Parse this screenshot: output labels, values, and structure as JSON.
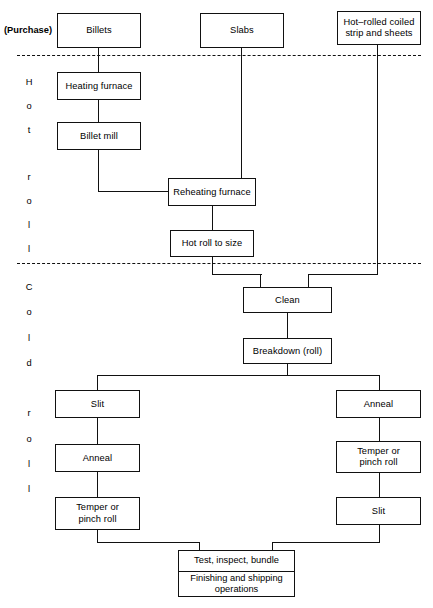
{
  "diagram": {
    "purchase_label": "(Purchase)",
    "stage_labels": {
      "hot": [
        "H",
        "o",
        "t",
        "",
        "r",
        "o",
        "l",
        "l"
      ],
      "cold": [
        "C",
        "o",
        "l",
        "d",
        "",
        "r",
        "o",
        "l",
        "l"
      ]
    },
    "nodes": {
      "billets": "Billets",
      "slabs": "Slabs",
      "hot_rolled_coil": "Hot–rolled coiled\nstrip and sheets",
      "hot_rolled_coil_line1": "Hot–rolled coiled",
      "hot_rolled_coil_line2": "strip and sheets",
      "heating_furnace": "Heating furnace",
      "billet_mill": "Billet mill",
      "reheating_furnace": "Reheating furnace",
      "hot_roll_to_size": "Hot roll to size",
      "clean": "Clean",
      "breakdown_roll": "Breakdown (roll)",
      "slit_left": "Slit",
      "anneal_right": "Anneal",
      "anneal_left": "Anneal",
      "temper_right_line1": "Temper or",
      "temper_right_line2": "pinch roll",
      "temper_left_line1": "Temper or",
      "temper_left_line2": "pinch roll",
      "slit_right": "Slit",
      "final_top": "Test, inspect, bundle",
      "final_bottom_line1": "Finishing and shipping",
      "final_bottom_line2": "operations"
    },
    "colors": {
      "stroke": "#111111",
      "background": "#ffffff",
      "text": "#000000"
    }
  }
}
